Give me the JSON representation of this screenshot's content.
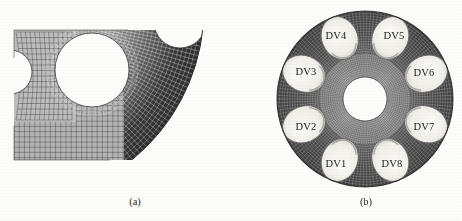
{
  "figure": {
    "background_color": "#fdfdfc",
    "panels": [
      {
        "id": "a",
        "caption": "(a)",
        "description": "close-up finite-element mesh of a quarter sector of the perforated annular disc"
      },
      {
        "id": "b",
        "caption": "(b)",
        "description": "full finite-element mesh of the annular disc with eight design-variable holes"
      }
    ]
  },
  "panel_a": {
    "caption": "(a)",
    "mesh": {
      "dark_color": "#3a3a3a",
      "mid_color": "#6e6e6e",
      "light_color": "#a9a9a9",
      "line_color": "#2b2b2b",
      "background_color": "#ffffff",
      "geometry": {
        "x": 14,
        "y": 30,
        "width": 200,
        "height": 130,
        "outer_arc_center_x": 8,
        "outer_arc_center_y": 8,
        "outer_arc_radius": 196,
        "left_notch_center_x": 10,
        "left_notch_center_y": 72,
        "left_notch_radius": 22,
        "main_hole_center_x": 92,
        "main_hole_center_y": 70,
        "main_hole_radius": 37,
        "top_notch_center_x": 180,
        "top_notch_center_y": 22,
        "top_notch_radius": 26
      },
      "cells_circumferential": 64,
      "cells_radial": 26
    }
  },
  "panel_b": {
    "caption": "(b)",
    "disc": {
      "center_x": 134,
      "center_y": 99,
      "outer_radius": 88,
      "bore_radius": 22,
      "inner_ring_outer_radius": 45,
      "outer_ring_color": "#4a4a4a",
      "inner_ring_color": "#8e8e8e",
      "hole_fill_color": "#f1efe9",
      "hole_edge_color": "#6b6b6b",
      "bore_fill_color": "#ffffff",
      "hole_count": 8,
      "hole_orbit_radius": 66,
      "hole_radius_x": 18,
      "hole_radius_y": 22
    },
    "holes": [
      {
        "label": "DV1",
        "angle_deg": 247.5,
        "label_x": 105,
        "label_y": 163
      },
      {
        "label": "DV2",
        "angle_deg": 202.5,
        "label_x": 75,
        "label_y": 126
      },
      {
        "label": "DV3",
        "angle_deg": 157.5,
        "label_x": 75,
        "label_y": 71
      },
      {
        "label": "DV4",
        "angle_deg": 112.5,
        "label_x": 105,
        "label_y": 35
      },
      {
        "label": "DV5",
        "angle_deg": 67.5,
        "label_x": 163,
        "label_y": 35
      },
      {
        "label": "DV6",
        "angle_deg": 22.5,
        "label_x": 193,
        "label_y": 72
      },
      {
        "label": "DV7",
        "angle_deg": 337.5,
        "label_x": 193,
        "label_y": 126
      },
      {
        "label": "DV8",
        "angle_deg": 292.5,
        "label_x": 161,
        "label_y": 163
      }
    ]
  }
}
